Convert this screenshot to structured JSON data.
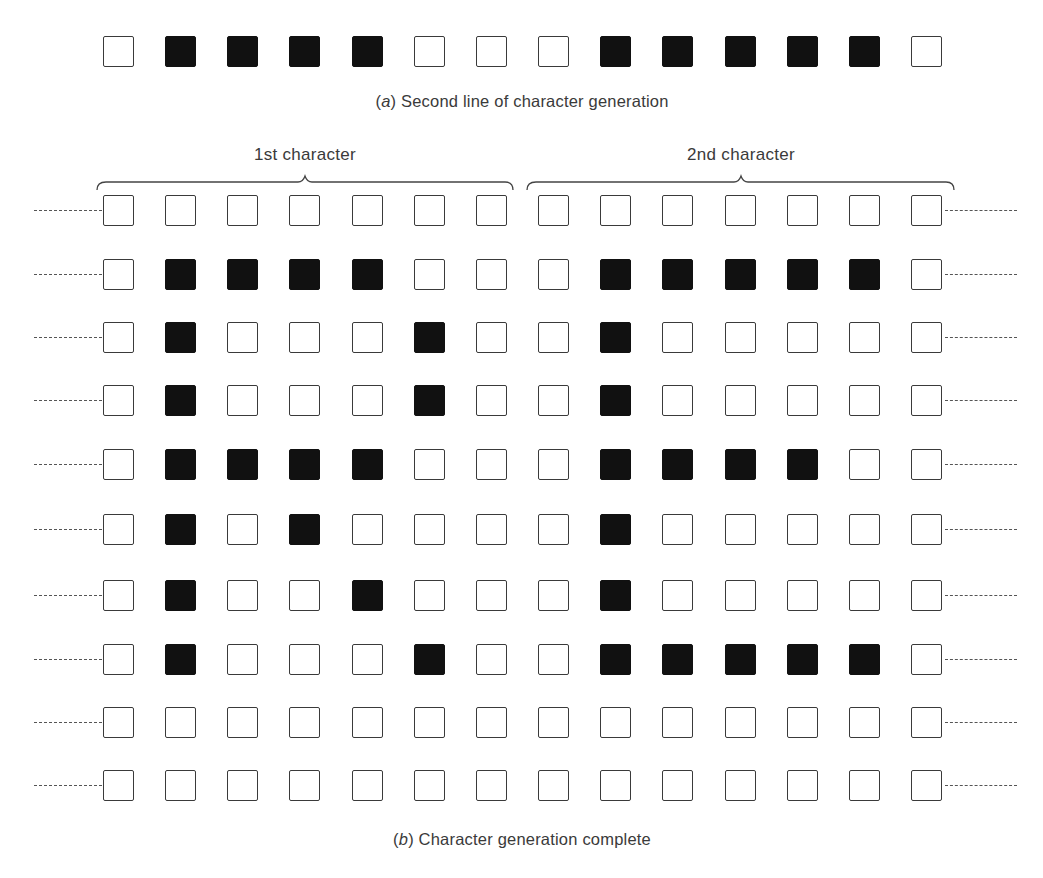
{
  "figure": {
    "part_a": {
      "caption_letter": "a",
      "caption_text": " Second line of character generation",
      "row": [
        0,
        1,
        1,
        1,
        1,
        0,
        0,
        0,
        1,
        1,
        1,
        1,
        1,
        0
      ]
    },
    "part_b": {
      "caption_letter": "b",
      "caption_text": " Character generation complete",
      "char1_label": "1st character",
      "char2_label": "2nd character",
      "columns_per_character": 7,
      "rows": [
        [
          0,
          0,
          0,
          0,
          0,
          0,
          0,
          0,
          0,
          0,
          0,
          0,
          0,
          0
        ],
        [
          0,
          1,
          1,
          1,
          1,
          0,
          0,
          0,
          1,
          1,
          1,
          1,
          1,
          0
        ],
        [
          0,
          1,
          0,
          0,
          0,
          1,
          0,
          0,
          1,
          0,
          0,
          0,
          0,
          0
        ],
        [
          0,
          1,
          0,
          0,
          0,
          1,
          0,
          0,
          1,
          0,
          0,
          0,
          0,
          0
        ],
        [
          0,
          1,
          1,
          1,
          1,
          0,
          0,
          0,
          1,
          1,
          1,
          1,
          0,
          0
        ],
        [
          0,
          1,
          0,
          1,
          0,
          0,
          0,
          0,
          1,
          0,
          0,
          0,
          0,
          0
        ],
        [
          0,
          1,
          0,
          0,
          1,
          0,
          0,
          0,
          1,
          0,
          0,
          0,
          0,
          0
        ],
        [
          0,
          1,
          0,
          0,
          0,
          1,
          0,
          0,
          1,
          1,
          1,
          1,
          1,
          0
        ],
        [
          0,
          0,
          0,
          0,
          0,
          0,
          0,
          0,
          0,
          0,
          0,
          0,
          0,
          0
        ],
        [
          0,
          0,
          0,
          0,
          0,
          0,
          0,
          0,
          0,
          0,
          0,
          0,
          0,
          0
        ]
      ],
      "characters_depicted": [
        "R",
        "E"
      ]
    },
    "colors": {
      "on": "#111111",
      "off": "#ffffff",
      "outline": "#3a3a3a"
    }
  }
}
